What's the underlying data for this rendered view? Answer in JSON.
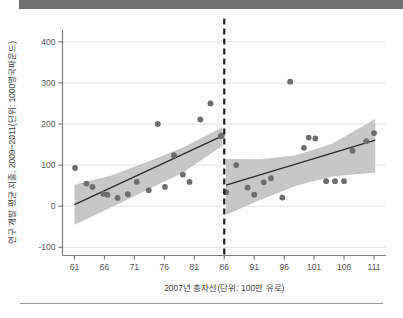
{
  "figure": {
    "banner_color": "#6f6f6f",
    "rule_color": "#9a9a9a",
    "background": "#ffffff"
  },
  "chart_data": {
    "type": "scatter",
    "title": "",
    "subtitle": "",
    "xlabel": "2007년 총자산(단위: 100만 유로)",
    "ylabel": "연구 개발 평균 지출, 2009~2011(단위: 1000영국파운드)",
    "xlim": [
      59.0,
      113.0
    ],
    "ylim": [
      -120,
      430
    ],
    "xticks": [
      61,
      66,
      71,
      76,
      81,
      86,
      91,
      96,
      101,
      106,
      111
    ],
    "xtick_labels": [
      "61",
      "66",
      "71",
      "76",
      "81",
      "86",
      "91",
      "96",
      "101",
      "106",
      "111"
    ],
    "yticks": [
      -100,
      0,
      100,
      200,
      300,
      400
    ],
    "ytick_labels": [
      "-100",
      "0",
      "100",
      "200",
      "300",
      "400"
    ],
    "grid": "horizontal",
    "legend": "none",
    "colors": {
      "point": "#6d6d6d",
      "band": "#c7c7c7",
      "fit_line": "#2b2b2b",
      "cutoff_line": "#222222",
      "gridline": "#e2e2e2",
      "axis": "#7d7d7d"
    },
    "annotations": [
      {
        "name": "cutoff-line",
        "type": "vertical-dashed-line",
        "x": 86,
        "label": ""
      }
    ],
    "series": [
      {
        "name": "좌측 구간 산점도 (총자산 < 86)",
        "type": "scatter",
        "points": [
          [
            61.1,
            93
          ],
          [
            63.0,
            55
          ],
          [
            64.0,
            47
          ],
          [
            65.8,
            30
          ],
          [
            66.5,
            28
          ],
          [
            68.2,
            20
          ],
          [
            69.9,
            29
          ],
          [
            71.4,
            59
          ],
          [
            73.4,
            39
          ],
          [
            74.9,
            200
          ],
          [
            76.1,
            47
          ],
          [
            77.6,
            124
          ],
          [
            79.1,
            77
          ],
          [
            80.2,
            59
          ],
          [
            82.0,
            211
          ],
          [
            83.7,
            250
          ],
          [
            85.4,
            170
          ],
          [
            85.6,
            172
          ]
        ]
      },
      {
        "name": "우측 구간 산점도 (총자산 ≥ 86)",
        "type": "scatter",
        "points": [
          [
            86.3,
            34
          ],
          [
            88.0,
            100
          ],
          [
            89.9,
            45
          ],
          [
            91.0,
            28
          ],
          [
            92.6,
            58
          ],
          [
            93.8,
            68
          ],
          [
            95.7,
            21
          ],
          [
            97.0,
            303
          ],
          [
            99.3,
            142
          ],
          [
            100.1,
            167
          ],
          [
            101.2,
            165
          ],
          [
            103.0,
            61
          ],
          [
            104.5,
            61
          ],
          [
            106.0,
            61
          ],
          [
            107.4,
            135
          ],
          [
            109.7,
            158
          ],
          [
            111.0,
            178
          ]
        ]
      },
      {
        "name": "좌측 회귀선",
        "type": "line",
        "points": [
          [
            61.0,
            4
          ],
          [
            85.7,
            171
          ]
        ]
      },
      {
        "name": "우측 회귀선",
        "type": "line",
        "points": [
          [
            86.3,
            51
          ],
          [
            111.2,
            161
          ]
        ]
      }
    ],
    "bands": [
      {
        "name": "좌측 신뢰구간",
        "x": [
          61.0,
          67.0,
          73.0,
          79.0,
          85.7
        ],
        "upper": [
          52,
          74,
          107,
          142,
          192
        ],
        "lower": [
          -45,
          -4,
          39,
          81,
          147
        ]
      },
      {
        "name": "우측 신뢰구간",
        "x": [
          86.3,
          92.0,
          98.0,
          104.0,
          111.2
        ],
        "upper": [
          115,
          114,
          124,
          152,
          212
        ],
        "lower": [
          -21,
          15,
          50,
          72,
          82
        ]
      }
    ]
  }
}
